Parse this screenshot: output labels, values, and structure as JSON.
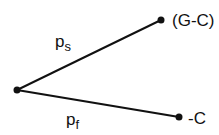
{
  "diagram": {
    "nodes": [
      {
        "id": "origin",
        "x": 17,
        "y": 90
      },
      {
        "id": "upper",
        "x": 161,
        "y": 20,
        "label": "(G-C)"
      },
      {
        "id": "lower",
        "x": 179,
        "y": 117,
        "label": "-C"
      }
    ],
    "edges": [
      {
        "from": "origin",
        "to": "upper",
        "label_base": "p",
        "label_sub": "s"
      },
      {
        "from": "origin",
        "to": "lower",
        "label_base": "p",
        "label_sub": "f"
      }
    ],
    "colors": {
      "line": "#111111",
      "node": "#111111",
      "text": "#111111"
    }
  }
}
